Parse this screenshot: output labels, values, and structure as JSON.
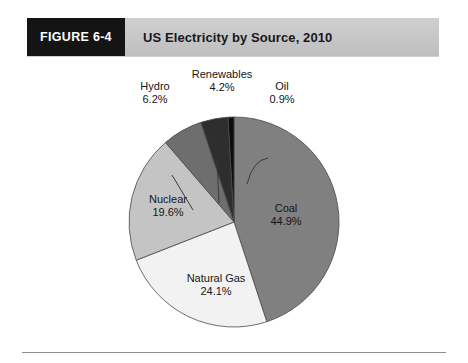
{
  "figure": {
    "tab_label": "FIGURE 6-4",
    "title": "US Electricity by Source, 2010"
  },
  "chart_data": {
    "type": "pie",
    "title": "US Electricity by Source, 2010",
    "unit": "%",
    "legend": "none",
    "labels_position": "on-slice and leader-line callouts",
    "categories": [
      "Coal",
      "Natural Gas",
      "Nuclear",
      "Hydro",
      "Renewables",
      "Oil"
    ],
    "values": [
      44.9,
      24.1,
      19.6,
      6.2,
      4.2,
      0.9
    ],
    "colors": [
      "#808080",
      "#f2f2f2",
      "#c4c4c4",
      "#6e6e6e",
      "#2e2e2e",
      "#0d0d0d"
    ],
    "slices": [
      {
        "name": "Coal",
        "value": 44.9,
        "label": "Coal",
        "value_label": "44.9%",
        "color": "#808080",
        "placement": "inside"
      },
      {
        "name": "Natural Gas",
        "value": 24.1,
        "label": "Natural Gas",
        "value_label": "24.1%",
        "color": "#f2f2f2",
        "placement": "inside"
      },
      {
        "name": "Nuclear",
        "value": 19.6,
        "label": "Nuclear",
        "value_label": "19.6%",
        "color": "#c4c4c4",
        "placement": "inside"
      },
      {
        "name": "Hydro",
        "value": 6.2,
        "label": "Hydro",
        "value_label": "6.2%",
        "color": "#6e6e6e",
        "placement": "callout"
      },
      {
        "name": "Renewables",
        "value": 4.2,
        "label": "Renewables",
        "value_label": "4.2%",
        "color": "#2e2e2e",
        "placement": "callout"
      },
      {
        "name": "Oil",
        "value": 0.9,
        "label": "Oil",
        "value_label": "0.9%",
        "color": "#0d0d0d",
        "placement": "callout"
      }
    ],
    "start_angle_deg": 0,
    "direction": "clockwise",
    "total": 99.9
  }
}
